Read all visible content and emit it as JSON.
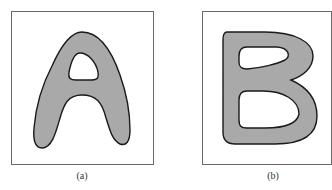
{
  "figure": {
    "panels": [
      {
        "id": "a",
        "letter": "A",
        "caption": "(a)"
      },
      {
        "id": "b",
        "letter": "B",
        "caption": "(b)"
      }
    ],
    "colors": {
      "shape_fill": "#a9a9a9",
      "shape_stroke": "#1a1a1a",
      "frame": "#6a6a6a",
      "background": "#ffffff"
    }
  }
}
